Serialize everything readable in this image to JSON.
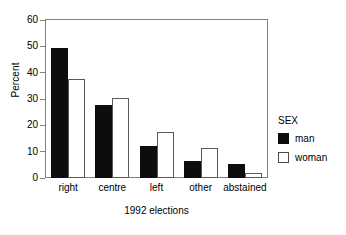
{
  "chart_data": {
    "type": "bar",
    "title": "",
    "subtitle": "",
    "xlabel": "1992 elections",
    "ylabel": "Percent",
    "categories": [
      "right",
      "centre",
      "left",
      "other",
      "abstained"
    ],
    "series": [
      {
        "name": "man",
        "color": "#0d0d0d",
        "values": [
          49.4,
          27.9,
          12.1,
          6.4,
          5.3
        ]
      },
      {
        "name": "woman",
        "color": "#ffffff",
        "values": [
          37.7,
          30.2,
          17.4,
          11.3,
          1.9
        ]
      }
    ],
    "ylim": [
      0,
      60
    ],
    "ytick_values": [
      0,
      10,
      20,
      30,
      40,
      50,
      60
    ],
    "ytick_labels": [
      "0",
      "10",
      "20",
      "30",
      "40",
      "50",
      "60"
    ],
    "grid": false,
    "legend": {
      "title": "SEX",
      "position": "right",
      "entries": [
        {
          "label": "man",
          "swatch": "filled-black"
        },
        {
          "label": "woman",
          "swatch": "outlined-white"
        }
      ]
    },
    "axis_color": "#808080",
    "background": "#ffffff"
  }
}
